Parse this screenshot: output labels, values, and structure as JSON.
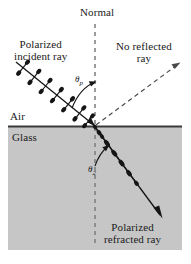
{
  "figure": {
    "title_alt": "Brewster angle polarization diagram",
    "colors": {
      "glass_fill": "#c6c6c6",
      "air_fill": "#ffffff",
      "interface_line": "#3a3a3a",
      "ray_stroke": "#151515",
      "dash_stroke": "#555555",
      "text": "#1a1a1a"
    }
  },
  "labels": {
    "normal": "Normal",
    "incident_line1": "Polarized",
    "incident_line2": "incident ray",
    "no_reflected_line1": "No reflected",
    "no_reflected_line2": "ray",
    "air": "Air",
    "glass": "Glass",
    "refracted_line1": "Polarized",
    "refracted_line2": "refracted ray",
    "theta_p": "θ",
    "theta_p_sub": "p",
    "theta_2": "θ",
    "theta_2_sub": "2"
  },
  "geometry": {
    "incidence_point_x": 95,
    "incidence_point_y": 126,
    "interface_y": 126,
    "normal_x": 95,
    "glass_rect": {
      "x": 8,
      "y": 126,
      "width": 174,
      "height": 124
    },
    "incident_ray": {
      "x1": 16,
      "y1": 62,
      "x2": 95,
      "y2": 126
    },
    "reflected_ray": {
      "x1": 95,
      "y1": 126,
      "x2": 180,
      "y2": 63
    },
    "refracted_ray": {
      "x1": 95,
      "y1": 126,
      "x2": 160,
      "y2": 215
    },
    "incident_tick_count": 7,
    "refracted_tick_count": 6
  }
}
